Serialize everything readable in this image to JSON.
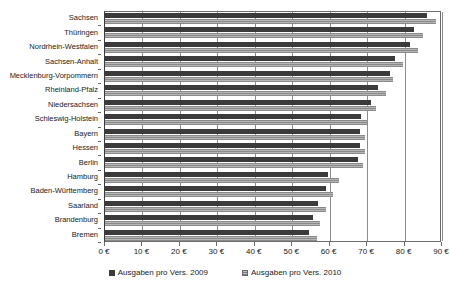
{
  "chart_data": {
    "type": "bar",
    "orientation": "horizontal",
    "title": "",
    "subtitle": "",
    "xlabel": "",
    "ylabel": "",
    "xlim": [
      0,
      90
    ],
    "xticks": [
      0,
      10,
      20,
      30,
      40,
      50,
      60,
      70,
      80,
      90
    ],
    "xtick_labels": [
      "0 €",
      "10 €",
      "20 €",
      "30 €",
      "40 €",
      "50 €",
      "60 €",
      "70 €",
      "80 €",
      "90 €"
    ],
    "grid": true,
    "grid_axis": "x",
    "legend_position": "bottom",
    "categories": [
      "Sachsen",
      "Thüringen",
      "Nordrhein-Westfalen",
      "Sachsen-Anhalt",
      "Mecklenburg-Vorpommern",
      "Rheinland-Pfalz",
      "Niedersachsen",
      "Schleswig-Holstein",
      "Bayern",
      "Hessen",
      "Berlin",
      "Hamburg",
      "Baden-Württemberg",
      "Saarland",
      "Brandenburg",
      "Bremen"
    ],
    "series": [
      {
        "name": "Ausgaben pro Vers. 2009",
        "color": "#3b3b3b",
        "values": [
          86.0,
          82.5,
          81.5,
          77.5,
          76.0,
          73.0,
          71.0,
          68.5,
          68.0,
          68.0,
          67.5,
          59.5,
          59.0,
          57.0,
          55.5,
          54.5
        ]
      },
      {
        "name": "Ausgaben pro Vers. 2010",
        "color": "#9a9a9a",
        "values": [
          88.5,
          85.0,
          83.5,
          79.5,
          77.0,
          75.0,
          72.5,
          70.0,
          69.5,
          69.5,
          69.0,
          62.5,
          61.0,
          59.0,
          57.5,
          56.5
        ]
      }
    ]
  },
  "legend": {
    "items": [
      {
        "label": "Ausgaben pro Vers. 2009"
      },
      {
        "label": "Ausgaben pro Vers. 2010"
      }
    ]
  }
}
